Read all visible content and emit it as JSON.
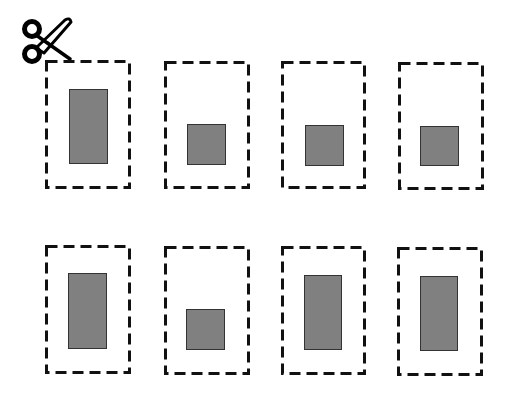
{
  "diagram": {
    "icon": "scissors-icon",
    "colors": {
      "dash": "#111111",
      "fill": "#808080",
      "fill_border": "#333333",
      "background": "#ffffff"
    },
    "cards": [
      {
        "row": 1,
        "col": 1,
        "x": 45,
        "y": 60,
        "w": 86,
        "h": 129,
        "shape": {
          "x": 69,
          "y": 89,
          "w": 39,
          "h": 75
        }
      },
      {
        "row": 1,
        "col": 2,
        "x": 164,
        "y": 61,
        "w": 86,
        "h": 128,
        "shape": {
          "x": 187,
          "y": 124,
          "w": 39,
          "h": 41
        }
      },
      {
        "row": 1,
        "col": 3,
        "x": 281,
        "y": 61,
        "w": 85,
        "h": 128,
        "shape": {
          "x": 305,
          "y": 125,
          "w": 39,
          "h": 41
        }
      },
      {
        "row": 1,
        "col": 4,
        "x": 398,
        "y": 62,
        "w": 86,
        "h": 128,
        "shape": {
          "x": 420,
          "y": 126,
          "w": 39,
          "h": 40
        }
      },
      {
        "row": 2,
        "col": 1,
        "x": 45,
        "y": 245,
        "w": 86,
        "h": 129,
        "shape": {
          "x": 68,
          "y": 273,
          "w": 39,
          "h": 76
        }
      },
      {
        "row": 2,
        "col": 2,
        "x": 164,
        "y": 246,
        "w": 86,
        "h": 129,
        "shape": {
          "x": 186,
          "y": 309,
          "w": 39,
          "h": 41
        }
      },
      {
        "row": 2,
        "col": 3,
        "x": 281,
        "y": 246,
        "w": 85,
        "h": 129,
        "shape": {
          "x": 304,
          "y": 275,
          "w": 38,
          "h": 75
        }
      },
      {
        "row": 2,
        "col": 4,
        "x": 397,
        "y": 247,
        "w": 86,
        "h": 129,
        "shape": {
          "x": 420,
          "y": 276,
          "w": 38,
          "h": 75
        }
      }
    ]
  }
}
